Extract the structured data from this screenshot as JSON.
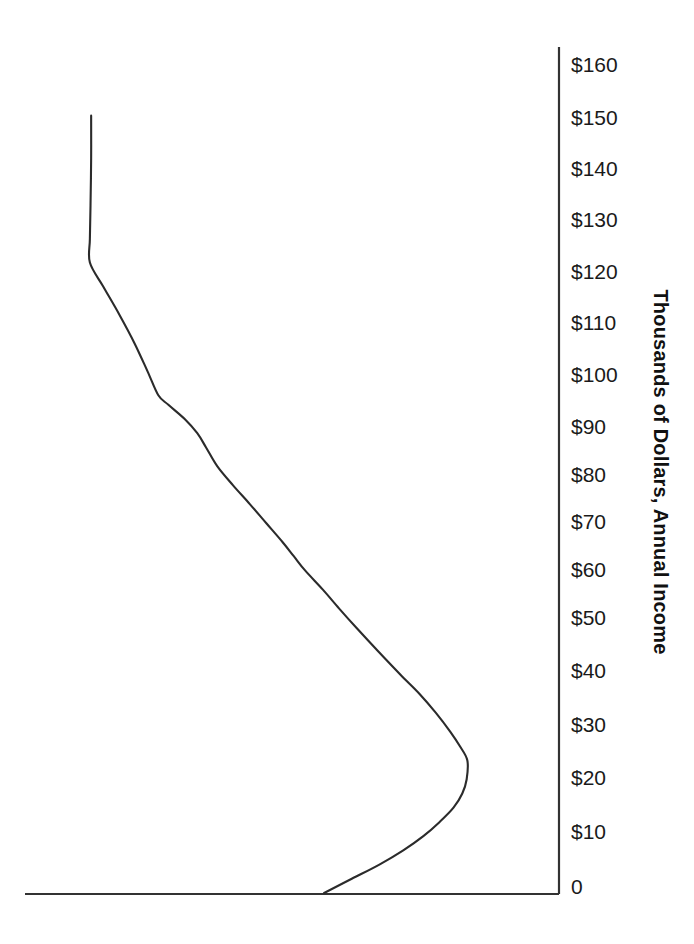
{
  "chart_data": {
    "type": "line",
    "title": "",
    "subtitle": "",
    "orientation": "horizontal-density",
    "xlabel": "",
    "ylabel": "Thousands of Dollars, Annual Income",
    "ylim": [
      0,
      165
    ],
    "xlim": [
      0,
      1
    ],
    "grid": false,
    "legend": null,
    "axis_title": "Thousands of Dollars, Annual Income",
    "axis_title_position": "right",
    "axis_title_rotation": 90,
    "y_tick_labels": [
      "$160",
      "$150",
      "$140",
      "$130",
      "$120",
      "$110",
      "$100",
      "$90",
      "$80",
      "$70",
      "$60",
      "$50",
      "$40",
      "$30",
      "$20",
      "$10",
      "0"
    ],
    "y_tick_values": [
      160,
      150,
      140,
      130,
      120,
      110,
      100,
      90,
      80,
      70,
      60,
      50,
      40,
      30,
      20,
      10,
      0
    ],
    "x_tick_labels": [],
    "x_tick_values": [],
    "series": [
      {
        "name": "Income distribution curve",
        "description": "Cumulative income curve rising steeply above $130k, with a shoulder near $100k and a leftward bulge near $28k",
        "points": [
          {
            "income": 164,
            "width": 0.745
          },
          {
            "income": 155,
            "width": 0.745
          },
          {
            "income": 145,
            "width": 0.746
          },
          {
            "income": 138,
            "width": 0.747
          },
          {
            "income": 133,
            "width": 0.747
          },
          {
            "income": 128,
            "width": 0.726
          },
          {
            "income": 122,
            "width": 0.7
          },
          {
            "income": 116,
            "width": 0.676
          },
          {
            "income": 110,
            "width": 0.655
          },
          {
            "income": 105,
            "width": 0.638
          },
          {
            "income": 103,
            "width": 0.622
          },
          {
            "income": 100,
            "width": 0.596
          },
          {
            "income": 97,
            "width": 0.576
          },
          {
            "income": 94,
            "width": 0.562
          },
          {
            "income": 90,
            "width": 0.544
          },
          {
            "income": 86,
            "width": 0.519
          },
          {
            "income": 82,
            "width": 0.492
          },
          {
            "income": 78,
            "width": 0.466
          },
          {
            "income": 74,
            "width": 0.44
          },
          {
            "income": 71,
            "width": 0.422
          },
          {
            "income": 68,
            "width": 0.404
          },
          {
            "income": 64,
            "width": 0.376
          },
          {
            "income": 60,
            "width": 0.35
          },
          {
            "income": 56,
            "width": 0.323
          },
          {
            "income": 51,
            "width": 0.288
          },
          {
            "income": 46,
            "width": 0.252
          },
          {
            "income": 42,
            "width": 0.222
          },
          {
            "income": 38,
            "width": 0.196
          },
          {
            "income": 34,
            "width": 0.173
          },
          {
            "income": 31,
            "width": 0.158
          },
          {
            "income": 28,
            "width": 0.146
          },
          {
            "income": 24,
            "width": 0.147
          },
          {
            "income": 21,
            "width": 0.154
          },
          {
            "income": 18,
            "width": 0.168
          },
          {
            "income": 15,
            "width": 0.19
          },
          {
            "income": 12,
            "width": 0.216
          },
          {
            "income": 9,
            "width": 0.248
          },
          {
            "income": 6,
            "width": 0.286
          },
          {
            "income": 3,
            "width": 0.33
          },
          {
            "income": 0,
            "width": 0.374
          }
        ]
      }
    ],
    "colors": {
      "background": "#ffffff",
      "axis": "#333333",
      "curve": "#2b2b2b",
      "text": "#1a1a1a"
    }
  },
  "axis": {
    "title": "Thousands of Dollars, Annual Income",
    "ticks": [
      {
        "label": "$160",
        "y": 64
      },
      {
        "label": "$150",
        "y": 117
      },
      {
        "label": "$140",
        "y": 168
      },
      {
        "label": "$130",
        "y": 219
      },
      {
        "label": "$120",
        "y": 271
      },
      {
        "label": "$110",
        "y": 322
      },
      {
        "label": "$100",
        "y": 374
      },
      {
        "label": "$90",
        "y": 426
      },
      {
        "label": "$80",
        "y": 474
      },
      {
        "label": "$70",
        "y": 521
      },
      {
        "label": "$60",
        "y": 569
      },
      {
        "label": "$50",
        "y": 617
      },
      {
        "label": "$40",
        "y": 670
      },
      {
        "label": "$30",
        "y": 724
      },
      {
        "label": "$20",
        "y": 777
      },
      {
        "label": "$10",
        "y": 831
      },
      {
        "label": "0",
        "y": 886
      }
    ]
  }
}
